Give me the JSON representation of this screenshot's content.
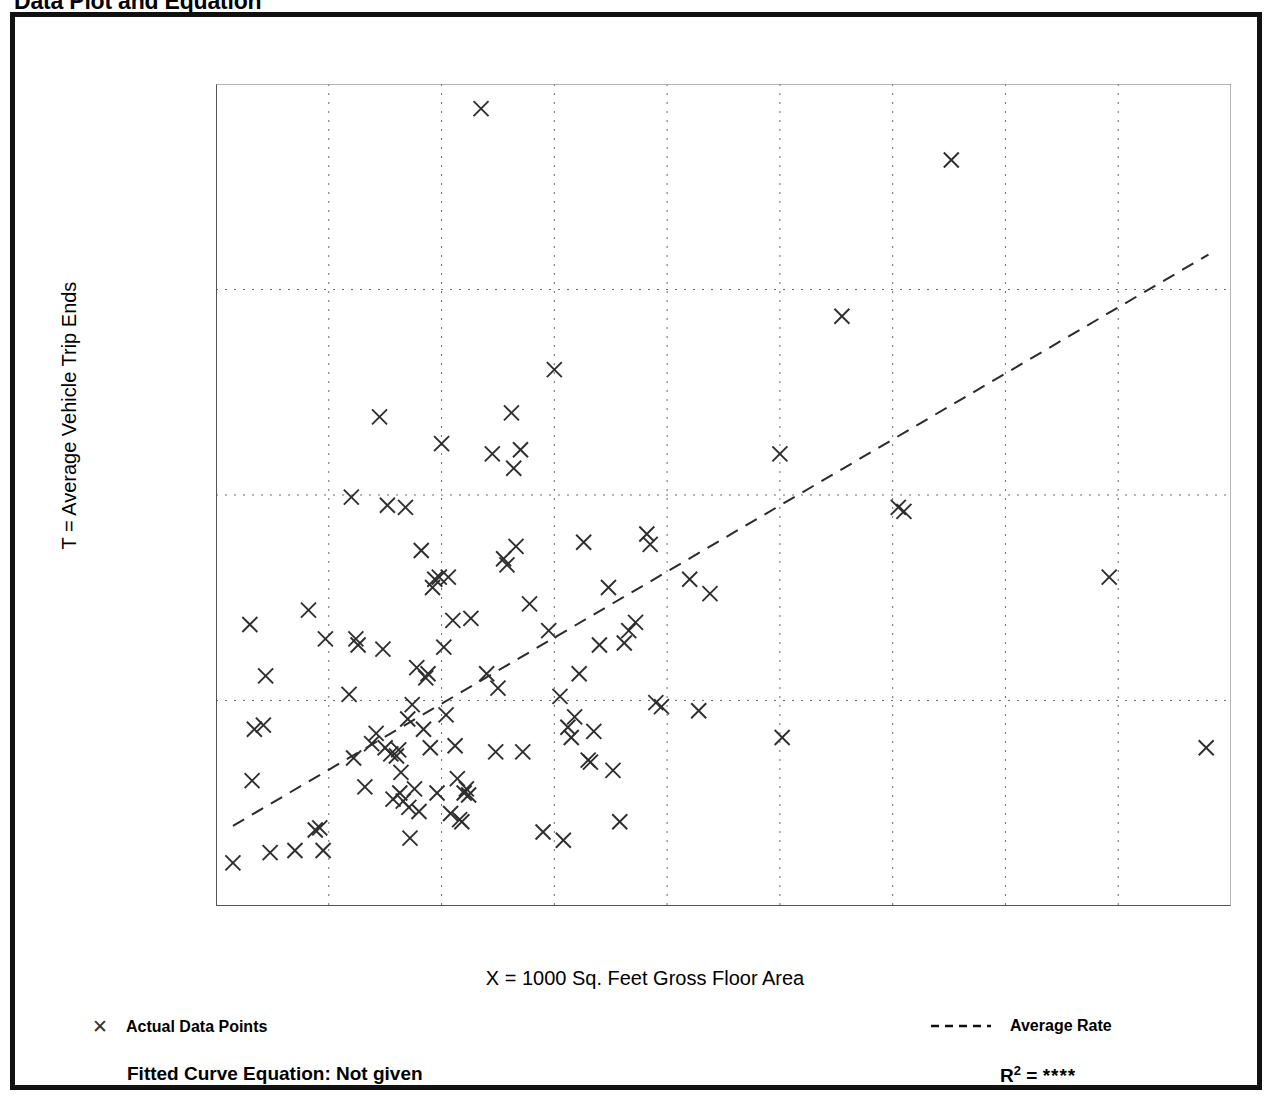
{
  "page": {
    "title": "Data Plot and Equation"
  },
  "legend": {
    "points": {
      "marker": "x-marker",
      "label": "Actual Data Points"
    },
    "rate": {
      "marker": "dashed-line",
      "label": "Average Rate"
    }
  },
  "footer": {
    "equation_label": "Fitted Curve Equation:  Not given",
    "r2_base": "R",
    "r2_sup": "2",
    "r2_eq": " = ",
    "r2_value": "****"
  },
  "chart_data": {
    "type": "scatter",
    "title": "Data Plot and Equation",
    "xlabel": "X = 1000 Sq. Feet Gross Floor Area",
    "ylabel": "T = Average Vehicle Trip Ends",
    "xlim": [
      1,
      10
    ],
    "ylim": [
      0,
      400
    ],
    "xticks": [
      1,
      2,
      3,
      4,
      5,
      6,
      7,
      8,
      9,
      10
    ],
    "xtick_labels": [
      "1",
      "2",
      "3",
      "4",
      "5",
      "6",
      "7",
      "8",
      "9",
      "10"
    ],
    "xminor_step": 0.5,
    "yticks": [
      0,
      100,
      200,
      300,
      400
    ],
    "ytick_labels": [
      "0",
      "100",
      "200",
      "300",
      "400"
    ],
    "yminor_step": 50,
    "grid": true,
    "grid_style": "dotted",
    "gridlines_x": [
      2,
      3,
      4,
      5,
      6,
      7,
      8,
      9
    ],
    "gridlines_y": [
      100,
      200,
      300
    ],
    "legend_position": "below-axes",
    "marker": "x",
    "series": [
      {
        "name": "Actual Data Points",
        "type": "scatter",
        "points": [
          [
            1.15,
            21
          ],
          [
            1.3,
            137
          ],
          [
            1.32,
            61
          ],
          [
            1.34,
            86
          ],
          [
            1.42,
            88
          ],
          [
            1.44,
            112
          ],
          [
            1.48,
            26
          ],
          [
            1.7,
            27
          ],
          [
            1.82,
            144
          ],
          [
            1.88,
            37
          ],
          [
            1.92,
            38
          ],
          [
            1.95,
            27
          ],
          [
            1.97,
            130
          ],
          [
            2.18,
            103
          ],
          [
            2.2,
            199
          ],
          [
            2.22,
            72
          ],
          [
            2.24,
            130
          ],
          [
            2.26,
            127
          ],
          [
            2.32,
            58
          ],
          [
            2.38,
            79
          ],
          [
            2.42,
            84
          ],
          [
            2.45,
            238
          ],
          [
            2.48,
            125
          ],
          [
            2.5,
            77
          ],
          [
            2.52,
            195
          ],
          [
            2.55,
            74
          ],
          [
            2.57,
            52
          ],
          [
            2.6,
            73
          ],
          [
            2.62,
            76
          ],
          [
            2.63,
            55
          ],
          [
            2.64,
            65
          ],
          [
            2.66,
            51
          ],
          [
            2.68,
            194
          ],
          [
            2.7,
            91
          ],
          [
            2.71,
            48
          ],
          [
            2.72,
            33
          ],
          [
            2.74,
            98
          ],
          [
            2.76,
            57
          ],
          [
            2.78,
            116
          ],
          [
            2.8,
            46
          ],
          [
            2.82,
            173
          ],
          [
            2.84,
            86
          ],
          [
            2.86,
            111
          ],
          [
            2.88,
            113
          ],
          [
            2.9,
            77
          ],
          [
            2.92,
            155
          ],
          [
            2.94,
            159
          ],
          [
            2.96,
            55
          ],
          [
            2.98,
            160
          ],
          [
            3.0,
            225
          ],
          [
            3.02,
            126
          ],
          [
            3.04,
            93
          ],
          [
            3.06,
            160
          ],
          [
            3.08,
            45
          ],
          [
            3.1,
            139
          ],
          [
            3.12,
            78
          ],
          [
            3.14,
            62
          ],
          [
            3.16,
            42
          ],
          [
            3.18,
            41
          ],
          [
            3.2,
            55
          ],
          [
            3.22,
            57
          ],
          [
            3.24,
            54
          ],
          [
            3.26,
            140
          ],
          [
            3.35,
            388
          ],
          [
            3.4,
            113
          ],
          [
            3.45,
            220
          ],
          [
            3.48,
            75
          ],
          [
            3.5,
            106
          ],
          [
            3.55,
            169
          ],
          [
            3.58,
            166
          ],
          [
            3.62,
            240
          ],
          [
            3.64,
            213
          ],
          [
            3.66,
            175
          ],
          [
            3.7,
            222
          ],
          [
            3.72,
            75
          ],
          [
            3.78,
            147
          ],
          [
            3.9,
            36
          ],
          [
            3.95,
            134
          ],
          [
            4.0,
            261
          ],
          [
            4.05,
            102
          ],
          [
            4.08,
            32
          ],
          [
            4.12,
            87
          ],
          [
            4.15,
            82
          ],
          [
            4.18,
            92
          ],
          [
            4.22,
            113
          ],
          [
            4.26,
            177
          ],
          [
            4.3,
            71
          ],
          [
            4.32,
            70
          ],
          [
            4.35,
            85
          ],
          [
            4.4,
            127
          ],
          [
            4.48,
            155
          ],
          [
            4.52,
            66
          ],
          [
            4.58,
            41
          ],
          [
            4.62,
            128
          ],
          [
            4.66,
            134
          ],
          [
            4.72,
            138
          ],
          [
            4.82,
            181
          ],
          [
            4.85,
            176
          ],
          [
            4.9,
            99
          ],
          [
            4.95,
            97
          ],
          [
            5.2,
            159
          ],
          [
            5.28,
            95
          ],
          [
            5.38,
            152
          ],
          [
            6.0,
            220
          ],
          [
            6.02,
            82
          ],
          [
            6.55,
            287
          ],
          [
            7.05,
            194
          ],
          [
            7.1,
            192
          ],
          [
            7.52,
            363
          ],
          [
            8.92,
            160
          ],
          [
            9.78,
            77
          ]
        ]
      },
      {
        "name": "Average Rate",
        "type": "line",
        "style": "dashed",
        "endpoints": [
          [
            1.15,
            39
          ],
          [
            9.8,
            317
          ]
        ]
      }
    ]
  }
}
